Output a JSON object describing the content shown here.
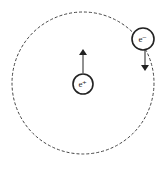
{
  "diagram": {
    "orbit": {
      "cx": 83,
      "cy": 83,
      "r": 71,
      "style": "dashed",
      "color": "#444444"
    },
    "positron": {
      "label": "e⁺",
      "cx": 83,
      "cy": 84,
      "r": 10,
      "velocity_direction": "up"
    },
    "electron": {
      "label": "e⁻",
      "cx": 143,
      "cy": 39,
      "r": 11,
      "velocity_direction": "down"
    }
  }
}
